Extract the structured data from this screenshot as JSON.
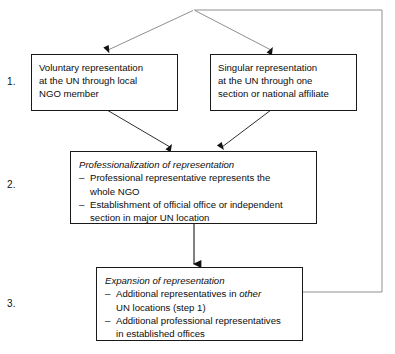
{
  "diagram": {
    "line_color": "#1a1a1a",
    "feedback_line_color": "#8c8c8c",
    "background": "#ffffff",
    "steps": [
      {
        "label": "1."
      },
      {
        "label": "2."
      },
      {
        "label": "3."
      }
    ],
    "nodes": {
      "voluntary": {
        "lines": [
          "Voluntary representation",
          "at the UN through local",
          "NGO member"
        ]
      },
      "singular": {
        "lines": [
          "Singular representation",
          "at the UN through one",
          "section or national affiliate"
        ]
      },
      "professionalization": {
        "title": "Professionalization of representation",
        "bullets": [
          {
            "mark": "–",
            "lines": [
              "Professional representative represents the",
              "whole NGO"
            ]
          },
          {
            "mark": "–",
            "lines": [
              "Establishment of official office or independent",
              "section in major UN location"
            ]
          }
        ]
      },
      "expansion": {
        "title": "Expansion of representation",
        "bullets": [
          {
            "mark": "–",
            "line1_pre": "Additional representatives in ",
            "line1_italic": "other",
            "line2": "UN locations (step 1)"
          },
          {
            "mark": "–",
            "line1_pre": "Additional professional representatives",
            "line1_italic": "",
            "line2": "in established offices"
          }
        ]
      }
    }
  }
}
